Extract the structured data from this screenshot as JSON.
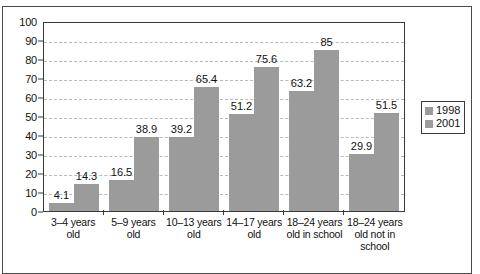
{
  "chart_data": {
    "type": "bar",
    "title": "",
    "subtitle": "",
    "xlabel": "",
    "ylabel": "",
    "ylim": [
      0,
      100
    ],
    "ytick_step": 10,
    "yticks": [
      "100",
      "90",
      "80",
      "70",
      "60",
      "50",
      "40",
      "30",
      "20",
      "10",
      "0"
    ],
    "grid": true,
    "legend_position": "right",
    "categories": [
      "3–4 years old",
      "5–9 years old",
      "10–13 years old",
      "14–17 years old",
      "18–24 years old in school",
      "18–24 years old not in school"
    ],
    "series": [
      {
        "name": "1998",
        "color": "#9b9b9b",
        "values": [
          4.1,
          16.5,
          39.2,
          51.2,
          63.2,
          29.9
        ],
        "labels": [
          "4.1",
          "16.5",
          "39.2",
          "51.2",
          "63.2",
          "29.9"
        ]
      },
      {
        "name": "2001",
        "color": "#9b9b9b",
        "values": [
          14.3,
          38.9,
          65.4,
          75.6,
          85,
          51.5
        ],
        "labels": [
          "14.3",
          "38.9",
          "65.4",
          "75.6",
          "85",
          "51.5"
        ]
      }
    ]
  },
  "legend": {
    "entries": [
      {
        "label": "1998",
        "color": "#9b9b9b"
      },
      {
        "label": "2001",
        "color": "#9b9b9b"
      }
    ]
  }
}
